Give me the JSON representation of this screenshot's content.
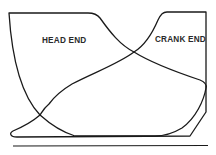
{
  "diagram": {
    "type": "steam-engine-indicator-diagram",
    "labels": {
      "head_end": "HEAD END",
      "crank_end": "CRANK END"
    },
    "curves": [
      {
        "name": "head-end-card",
        "description": "Admission line along top left, expansion curve descending to right, exhaust line along bottom, compression rising on left"
      },
      {
        "name": "crank-end-card",
        "description": "Admission line along top right, expansion curve descending to left, exhaust line along bottom, compression rising on right"
      },
      {
        "name": "atmospheric-line",
        "description": "Horizontal reference line beneath both cards"
      }
    ],
    "colors": {
      "line": "#1a1a1a",
      "background": "#ffffff"
    }
  }
}
